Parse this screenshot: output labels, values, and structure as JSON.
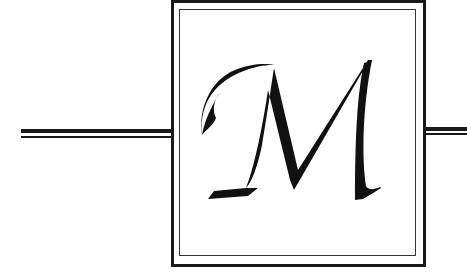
{
  "ornament": {
    "letter": "M",
    "style": "calligraphic-drop-cap",
    "frame": "double-rule-square",
    "rules": "double-horizontal-rules-left-and-right"
  },
  "colors": {
    "ink": "#111111",
    "rule": "#1a1a1a",
    "background": "#ffffff"
  }
}
